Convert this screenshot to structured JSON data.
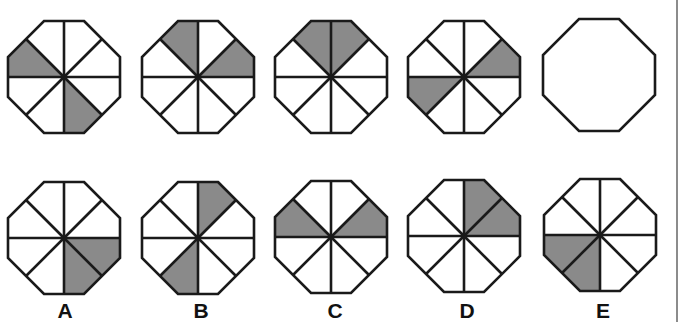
{
  "colors": {
    "stroke": "#1a1a1a",
    "shade": "#8a8a8a",
    "fill": "#ffffff",
    "rule": "#8c8c8c"
  },
  "geometry": {
    "half_size": 56,
    "half_edge": 20,
    "stroke_width": 2.6,
    "sector_order_note": "s0=right-upper, s1=top-right, s2=top-left, s3=left-upper, s4=left-lower, s5=bottom-left, s6=bottom-right, s7=right-lower"
  },
  "sequence": [
    {
      "id": "seq-1",
      "cx": 64,
      "cy": 77,
      "divided": true,
      "shaded": [
        3,
        6
      ]
    },
    {
      "id": "seq-2",
      "cx": 198,
      "cy": 77,
      "divided": true,
      "shaded": [
        2,
        0
      ]
    },
    {
      "id": "seq-3",
      "cx": 331,
      "cy": 77,
      "divided": true,
      "shaded": [
        1,
        2
      ]
    },
    {
      "id": "seq-4",
      "cx": 464,
      "cy": 77,
      "divided": true,
      "shaded": [
        0,
        4
      ]
    },
    {
      "id": "seq-5-blank",
      "cx": 599,
      "cy": 75,
      "divided": false,
      "shaded": []
    }
  ],
  "options": [
    {
      "label": "A",
      "cx": 64,
      "cy": 238,
      "label_x": 65,
      "label_y": 300,
      "shaded": [
        7,
        6
      ]
    },
    {
      "label": "B",
      "cx": 198,
      "cy": 238,
      "label_x": 201,
      "label_y": 300,
      "shaded": [
        1,
        5
      ]
    },
    {
      "label": "C",
      "cx": 331,
      "cy": 237,
      "label_x": 335,
      "label_y": 300,
      "shaded": [
        3,
        0
      ]
    },
    {
      "label": "D",
      "cx": 464,
      "cy": 236,
      "label_x": 467,
      "label_y": 300,
      "shaded": [
        1,
        0
      ]
    },
    {
      "label": "E",
      "cx": 600,
      "cy": 235,
      "label_x": 603,
      "label_y": 300,
      "shaded": [
        4,
        5
      ]
    }
  ]
}
